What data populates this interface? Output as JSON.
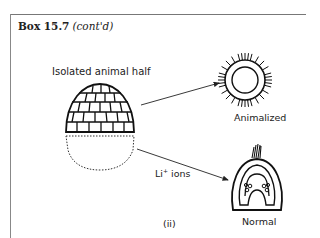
{
  "box": {
    "title": "Box 15.7",
    "subtitle": "(cont'd)"
  },
  "figure": {
    "panel_label": "(ii)",
    "labels": {
      "isolated_animal_half": "Isolated animal half",
      "animalized": "Animalized",
      "li_ions_prefix": "Li",
      "li_ions_sup": "+",
      "li_ions_suffix": " ions",
      "normal": "Normal"
    }
  }
}
